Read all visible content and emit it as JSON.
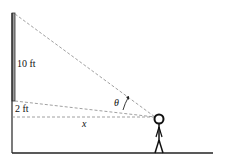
{
  "diagram": {
    "labels": {
      "top_segment": "10 ft",
      "bottom_segment": "2 ft",
      "distance": "x",
      "angle": "θ"
    },
    "colors": {
      "line": "#222222",
      "dash": "#888888",
      "pole": "#999999"
    }
  }
}
